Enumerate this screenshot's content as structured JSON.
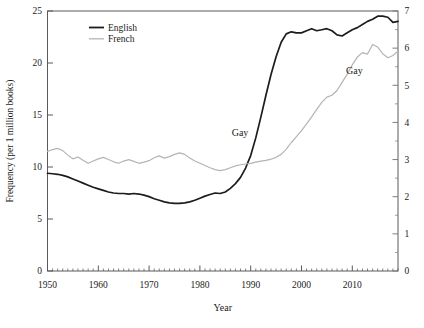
{
  "window": {
    "width": 424,
    "height": 328,
    "background": "#ffffff"
  },
  "colors": {
    "axis": "#5a5a5a",
    "text": "#1a1a1a",
    "right_axis_text": "#8f8f8f",
    "english_line": "#1c1c1c",
    "french_line": "#b4b4b4"
  },
  "chart_data": {
    "type": "line",
    "title": "",
    "xlabel": "Year",
    "ylabel": "Frequency (per 1 million books)",
    "grid": false,
    "x_range": [
      1950,
      2019
    ],
    "x_major_ticks": [
      1950,
      1960,
      1970,
      1980,
      1990,
      2000,
      2010
    ],
    "x_minor_step": 1,
    "left_axis": {
      "range": [
        0,
        25
      ],
      "ticks": [
        0,
        5,
        10,
        15,
        20,
        25
      ]
    },
    "right_axis": {
      "range": [
        0,
        7
      ],
      "ticks": [
        0,
        1,
        2,
        3,
        4,
        5,
        6,
        7
      ],
      "minor_step": 0.5
    },
    "legend": {
      "position": "top-left-inside",
      "entries": [
        {
          "label": "English",
          "color": "#1c1c1c",
          "line_width": 1.8
        },
        {
          "label": "French",
          "color": "#b4b4b4",
          "line_width": 1.3
        }
      ]
    },
    "annotations": [
      {
        "text": "Gay",
        "series": "English",
        "axis": "left",
        "x": 1987.9,
        "y": 13.3
      },
      {
        "text": "Gay",
        "series": "French",
        "axis": "right",
        "x": 2010.4,
        "y": 5.4
      }
    ],
    "x_start": 1950,
    "series": [
      {
        "name": "English",
        "axis": "left",
        "color": "#1c1c1c",
        "line_width": 1.7,
        "values": [
          9.4,
          9.35,
          9.3,
          9.2,
          9.05,
          8.85,
          8.65,
          8.45,
          8.25,
          8.05,
          7.9,
          7.75,
          7.6,
          7.5,
          7.45,
          7.45,
          7.4,
          7.45,
          7.4,
          7.3,
          7.15,
          6.95,
          6.8,
          6.65,
          6.55,
          6.5,
          6.5,
          6.55,
          6.65,
          6.8,
          7.0,
          7.2,
          7.35,
          7.5,
          7.45,
          7.6,
          7.95,
          8.4,
          9.0,
          9.9,
          11.1,
          12.8,
          14.8,
          16.9,
          18.9,
          20.6,
          22.0,
          22.8,
          23.0,
          22.9,
          22.9,
          23.1,
          23.3,
          23.1,
          23.2,
          23.3,
          23.1,
          22.7,
          22.6,
          22.9,
          23.2,
          23.4,
          23.7,
          24.0,
          24.2,
          24.5,
          24.5,
          24.4,
          23.9,
          24.0
        ]
      },
      {
        "name": "French",
        "axis": "right",
        "color": "#b4b4b4",
        "line_width": 1.2,
        "values": [
          3.22,
          3.27,
          3.3,
          3.24,
          3.12,
          3.02,
          3.07,
          2.98,
          2.9,
          2.96,
          3.02,
          3.06,
          3.0,
          2.94,
          2.9,
          2.96,
          3.0,
          2.95,
          2.9,
          2.93,
          2.97,
          3.05,
          3.1,
          3.04,
          3.08,
          3.14,
          3.18,
          3.14,
          3.04,
          2.96,
          2.9,
          2.84,
          2.78,
          2.73,
          2.7,
          2.73,
          2.78,
          2.83,
          2.86,
          2.88,
          2.9,
          2.93,
          2.96,
          2.98,
          3.01,
          3.06,
          3.14,
          3.28,
          3.46,
          3.62,
          3.78,
          3.96,
          4.15,
          4.35,
          4.54,
          4.68,
          4.73,
          4.86,
          5.08,
          5.3,
          5.55,
          5.76,
          5.88,
          5.84,
          6.1,
          6.03,
          5.85,
          5.74,
          5.8,
          5.92
        ]
      }
    ]
  }
}
